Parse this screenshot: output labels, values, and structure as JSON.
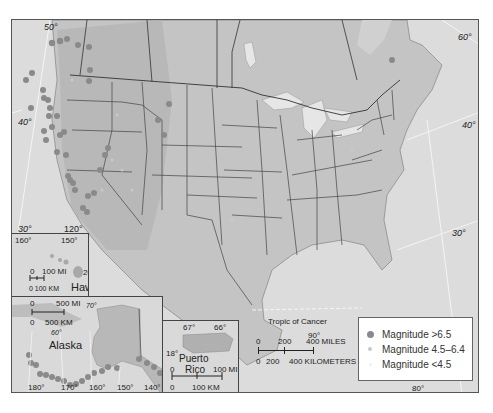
{
  "map": {
    "title": "",
    "latitude_labels_main": [
      {
        "text": "50°",
        "x": 34,
        "y": 4
      },
      {
        "text": "40°",
        "x": 8,
        "y": 100
      },
      {
        "text": "30°",
        "x": 8,
        "y": 206
      },
      {
        "text": "120°",
        "x": 53,
        "y": 207
      },
      {
        "text": "60°",
        "x": 448,
        "y": 15
      },
      {
        "text": "40°",
        "x": 452,
        "y": 103
      },
      {
        "text": "30°",
        "x": 442,
        "y": 211
      },
      {
        "text": "Tropic of Cancer",
        "x": 257,
        "y": 300,
        "italic": false
      },
      {
        "text": "90°",
        "x": 298,
        "y": 313
      },
      {
        "text": "80°",
        "x": 401,
        "y": 369
      }
    ],
    "scale_bar": {
      "miles_labels": [
        "0",
        "200",
        "400 MILES"
      ],
      "km_labels": [
        "0",
        "200",
        "400 KILOMETERS"
      ]
    },
    "legend": {
      "items": [
        {
          "label": "Magnitude >6.5",
          "color": "#8a8a8a",
          "size": 7
        },
        {
          "label": "Magnitude 4.5–6.4",
          "color": "#c8c8c8",
          "size": 4
        },
        {
          "label": "Magnitude <4.5",
          "color": "#f0f0f0",
          "size": 3
        }
      ]
    },
    "insets": {
      "hawaii": {
        "name": "Hawaii",
        "lon_labels": [
          "160°",
          "150°"
        ],
        "lat_label": "20°",
        "scale_mi": [
          "0",
          "100 MI"
        ],
        "scale_km": "0 100 KM"
      },
      "alaska": {
        "name": "Alaska",
        "scale_mi": [
          "0",
          "500 MI"
        ],
        "scale_km": [
          "0",
          "500 KM"
        ],
        "lat_labels": [
          "70°",
          "60°"
        ],
        "lon_labels": [
          "180°",
          "170°",
          "160°",
          "150°",
          "140°"
        ]
      },
      "puerto_rico": {
        "name_line1": "Puerto",
        "name_line2": "Rico",
        "lon_labels": [
          "67°",
          "66°"
        ],
        "lat_label": "18°",
        "scale_mi": [
          "0",
          "100 MI"
        ],
        "scale_km": [
          "0",
          "100 KM"
        ]
      }
    },
    "colors": {
      "land": "#c4c4c4",
      "ocean": "#dcdcdc",
      "mountains": "#b0b0b0",
      "border": "#444444",
      "lake": "#e6e6e6",
      "quake_large": "#8a8a8a",
      "quake_medium": "#c8c8c8"
    }
  }
}
